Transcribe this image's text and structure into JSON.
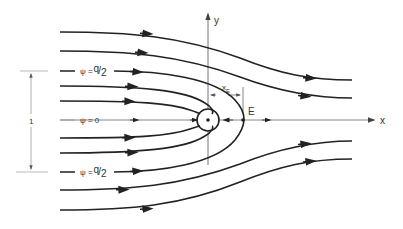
{
  "diagram": {
    "type": "streamline-flow-past-source",
    "axes": {
      "x_label": "x",
      "y_label": "y"
    },
    "labels": {
      "psi_top": "ψ = q/2",
      "psi_top_prefix": "ψ =",
      "psi_top_num": "q",
      "psi_top_den": "2",
      "psi_center": "ψ = 0",
      "psi_bottom_prefix": "ψ =",
      "psi_bottom_num": "q",
      "psi_bottom_den": "2",
      "xE_main": "x",
      "xE_sub": "E",
      "stagnation_point": "E",
      "dimension": "1"
    },
    "colors": {
      "streamline": "#222222",
      "axis": "#777777",
      "dimension": "#999999"
    }
  }
}
